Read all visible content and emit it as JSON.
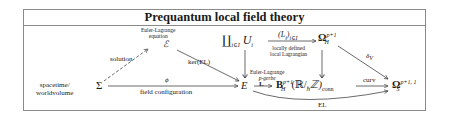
{
  "title": "Prequantum local field theory",
  "side_label": [
    "spacetime/",
    "worldvolume"
  ],
  "objects": {
    "sigma": "Σ",
    "e_field": "E",
    "euler_lagrange_eq": {
      "caption": [
        "Euler-Lagrange",
        "equation"
      ],
      "symbol": "ℰ"
    },
    "coproduct": {
      "symbol": "∐",
      "index": "i∈I",
      "var": "U",
      "sub": "i"
    },
    "omega_h": {
      "symbol": "Ω",
      "sup": "p+1",
      "sub": "H"
    },
    "b_h": {
      "symbol": "B",
      "sup": "p+1",
      "sub": "H",
      "rest": "(ℝ/",
      "hbar": "ℏ",
      "z": "ℤ)",
      "conn": "conn"
    },
    "omega_s": {
      "symbol": "Ω",
      "sup": "p+1, 1",
      "sub": "S"
    }
  },
  "arrows": {
    "solution": "solution",
    "ker_el": "ker(EL)",
    "phi": "ϕ",
    "field_configuration": "field configuration",
    "local_lagrangians_top": "(L",
    "local_lagrangians_sub": "i",
    "local_lagrangians_tail": ")",
    "local_lagrangians_idx": "i∈I",
    "local_lagrangians_caption": [
      "locally defined",
      "local Lagrangian"
    ],
    "el_pgerbe_caption": [
      "Euler-Lagrange",
      "p-gerbe"
    ],
    "el_pgerbe_symbol": "L",
    "delta_v": "δ",
    "delta_v_sub": "V",
    "curv": "curv",
    "el": "EL"
  }
}
